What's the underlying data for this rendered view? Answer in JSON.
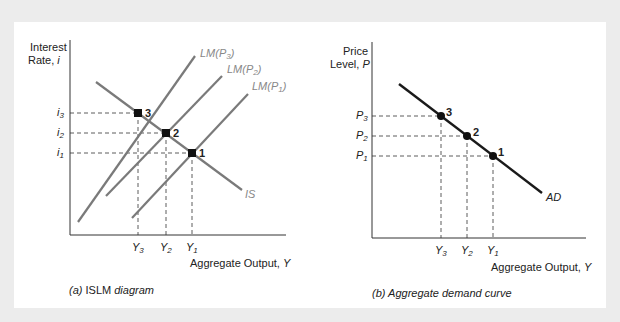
{
  "panels": [
    {
      "caption_prefix": "(a)",
      "caption_main": " ISLM ",
      "caption_suffix": "diagram",
      "y_axis_label_line1": "Interest",
      "y_axis_label_line2": "Rate, ",
      "y_axis_symbol": "i",
      "x_axis_label": "Aggregate Output, ",
      "x_axis_symbol": "Y",
      "curves": {
        "is": "IS",
        "lm3": "LM(P",
        "lm2": "LM(P",
        "lm1": "LM(P",
        "lm_sub3": "3",
        "lm_sub2": "2",
        "lm_sub1": "1",
        "close": ")"
      },
      "y_ticks": [
        {
          "sym": "i",
          "sub": "3"
        },
        {
          "sym": "i",
          "sub": "2"
        },
        {
          "sym": "i",
          "sub": "1"
        }
      ],
      "x_ticks": [
        {
          "sym": "Y",
          "sub": "3"
        },
        {
          "sym": "Y",
          "sub": "2"
        },
        {
          "sym": "Y",
          "sub": "1"
        }
      ],
      "points": [
        "3",
        "2",
        "1"
      ]
    },
    {
      "caption": "(b) Aggregate demand curve",
      "y_axis_label_line1": "Price",
      "y_axis_label_line2": "Level, ",
      "y_axis_symbol": "P",
      "x_axis_label": "Aggregate Output, ",
      "x_axis_symbol": "Y",
      "curves": {
        "ad": "AD"
      },
      "y_ticks": [
        {
          "sym": "P",
          "sub": "3"
        },
        {
          "sym": "P",
          "sub": "2"
        },
        {
          "sym": "P",
          "sub": "1"
        }
      ],
      "x_ticks": [
        {
          "sym": "Y",
          "sub": "3"
        },
        {
          "sym": "Y",
          "sub": "2"
        },
        {
          "sym": "Y",
          "sub": "1"
        }
      ],
      "points": [
        "3",
        "2",
        "1"
      ]
    }
  ],
  "colors": {
    "curve_gray": "#7a7a7a",
    "ad_black": "#1a1a1a",
    "background": "#ececec"
  }
}
